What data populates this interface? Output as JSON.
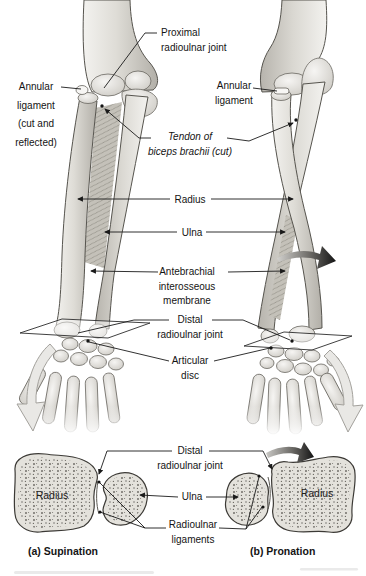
{
  "figure_labels": {
    "proximal_radioulnar_joint": "Proximal\nradioulnar joint",
    "annular_ligament_cut": "Annular\nligament\n(cut and\nreflected)",
    "annular_ligament": "Annular\nligament",
    "tendon_of_biceps": "Tendon of\nbiceps brachii (cut)",
    "radius": "Radius",
    "ulna": "Ulna",
    "antebrachial_interosseous_membrane": "Antebrachial\ninterosseous\nmembrane",
    "distal_radioulnar_joint": "Distal\nradioulnar joint",
    "articular_disc": "Articular\ndisc"
  },
  "cross_section_labels": {
    "distal_radioulnar_joint": "Distal\nradioulnar joint",
    "ulna": "Ulna",
    "radioulnar_ligaments": "Radioulnar\nligaments",
    "radius_left": "Radius",
    "radius_right": "Radius"
  },
  "captions": {
    "panel_a": "(a) Supination",
    "panel_b": "(b) Pronation"
  },
  "colors": {
    "background": "#ffffff",
    "bone_light": "#f3f2ef",
    "bone_mid": "#dddbd5",
    "bone_shadow": "#b2afa8",
    "outline": "#4a4843",
    "leader_line": "#1a1a1a",
    "membrane": "#c4c1b9",
    "stipple": "#54524c",
    "rotation_arrow_dark": "#141414",
    "swing_arrow_fill": "#e9e8e5",
    "swing_arrow_stroke": "#a3a19c"
  }
}
